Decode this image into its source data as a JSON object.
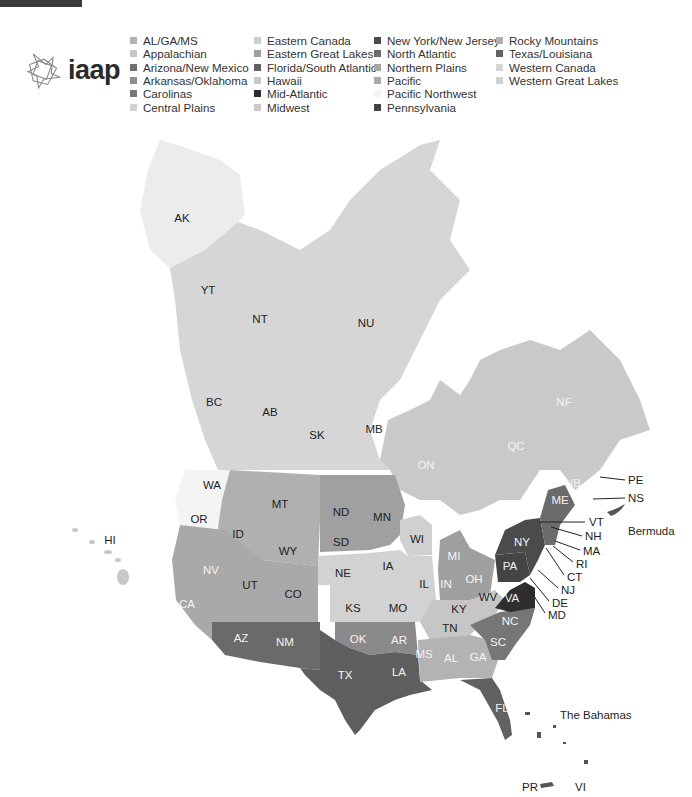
{
  "header": {
    "logo_text": "iaap"
  },
  "legend": {
    "columns": [
      [
        {
          "label": "AL/GA/MS",
          "color": "#b3b3b3"
        },
        {
          "label": "Appalachian",
          "color": "#c6c6c6"
        },
        {
          "label": "Arizona/New Mexico",
          "color": "#707070"
        },
        {
          "label": "Arkansas/Oklahoma",
          "color": "#8e8e8e"
        },
        {
          "label": "Carolinas",
          "color": "#767676"
        },
        {
          "label": "Central Plains",
          "color": "#d2d2d2"
        }
      ],
      [
        {
          "label": "Eastern Canada",
          "color": "#cdcdcd"
        },
        {
          "label": "Eastern Great Lakes",
          "color": "#9f9f9f"
        },
        {
          "label": "Florida/South Atlantic",
          "color": "#616161"
        },
        {
          "label": "Hawaii",
          "color": "#c8c8c8"
        },
        {
          "label": "Mid-Atlantic",
          "color": "#2e2e2e"
        },
        {
          "label": "Midwest",
          "color": "#c9c9c9"
        }
      ],
      [
        {
          "label": "New York/New Jersey",
          "color": "#4b4b4b"
        },
        {
          "label": "North Atlantic",
          "color": "#6b6b6b"
        },
        {
          "label": "Northern Plains",
          "color": "#a6a6a6"
        },
        {
          "label": "Pacific",
          "color": "#a9a9a9"
        },
        {
          "label": "Pacific Northwest",
          "color": "#f4f4f4"
        },
        {
          "label": "Pennsylvania",
          "color": "#444444"
        }
      ],
      [
        {
          "label": "Rocky Mountains",
          "color": "#b0b0b0"
        },
        {
          "label": "Texas/Louisiana",
          "color": "#626262"
        },
        {
          "label": "Western Canada",
          "color": "#d6d6d6"
        },
        {
          "label": "Western Great Lakes",
          "color": "#d0d0d0"
        }
      ]
    ]
  },
  "map": {
    "labels": [
      {
        "text": "AK",
        "x": 182,
        "y": 218,
        "light": false
      },
      {
        "text": "YT",
        "x": 208,
        "y": 290,
        "light": false
      },
      {
        "text": "NT",
        "x": 260,
        "y": 319,
        "light": false
      },
      {
        "text": "NU",
        "x": 366,
        "y": 323,
        "light": false
      },
      {
        "text": "BC",
        "x": 214,
        "y": 402,
        "light": false
      },
      {
        "text": "AB",
        "x": 270,
        "y": 412,
        "light": false
      },
      {
        "text": "SK",
        "x": 317,
        "y": 435,
        "light": false
      },
      {
        "text": "MB",
        "x": 374,
        "y": 429,
        "light": false
      },
      {
        "text": "ON",
        "x": 426,
        "y": 465,
        "light": true
      },
      {
        "text": "QC",
        "x": 516,
        "y": 446,
        "light": true
      },
      {
        "text": "NF",
        "x": 564,
        "y": 402,
        "light": true
      },
      {
        "text": "NB",
        "x": 573,
        "y": 483,
        "light": true
      },
      {
        "text": "ME",
        "x": 560,
        "y": 500,
        "light": true
      },
      {
        "text": "WA",
        "x": 212,
        "y": 485,
        "light": false
      },
      {
        "text": "OR",
        "x": 199,
        "y": 519,
        "light": false
      },
      {
        "text": "ID",
        "x": 238,
        "y": 534,
        "light": false
      },
      {
        "text": "MT",
        "x": 280,
        "y": 504,
        "light": false
      },
      {
        "text": "ND",
        "x": 341,
        "y": 512,
        "light": false
      },
      {
        "text": "MN",
        "x": 382,
        "y": 517,
        "light": false
      },
      {
        "text": "WY",
        "x": 288,
        "y": 551,
        "light": false
      },
      {
        "text": "SD",
        "x": 341,
        "y": 542,
        "light": false
      },
      {
        "text": "WI",
        "x": 417,
        "y": 539,
        "light": false
      },
      {
        "text": "MI",
        "x": 454,
        "y": 556,
        "light": true
      },
      {
        "text": "NY",
        "x": 522,
        "y": 542,
        "light": true
      },
      {
        "text": "NV",
        "x": 211,
        "y": 570,
        "light": true
      },
      {
        "text": "UT",
        "x": 250,
        "y": 585,
        "light": false
      },
      {
        "text": "CO",
        "x": 293,
        "y": 594,
        "light": false
      },
      {
        "text": "NE",
        "x": 343,
        "y": 573,
        "light": false
      },
      {
        "text": "IA",
        "x": 388,
        "y": 566,
        "light": false
      },
      {
        "text": "IL",
        "x": 424,
        "y": 584,
        "light": false
      },
      {
        "text": "IN",
        "x": 446,
        "y": 584,
        "light": true
      },
      {
        "text": "OH",
        "x": 474,
        "y": 579,
        "light": true
      },
      {
        "text": "PA",
        "x": 510,
        "y": 566,
        "light": true
      },
      {
        "text": "WV",
        "x": 488,
        "y": 597,
        "light": false
      },
      {
        "text": "VA",
        "x": 512,
        "y": 598,
        "light": true
      },
      {
        "text": "KY",
        "x": 459,
        "y": 609,
        "light": false
      },
      {
        "text": "KS",
        "x": 353,
        "y": 608,
        "light": false
      },
      {
        "text": "MO",
        "x": 398,
        "y": 608,
        "light": false
      },
      {
        "text": "CA",
        "x": 187,
        "y": 604,
        "light": true
      },
      {
        "text": "AZ",
        "x": 241,
        "y": 638,
        "light": true
      },
      {
        "text": "NM",
        "x": 285,
        "y": 642,
        "light": true
      },
      {
        "text": "OK",
        "x": 358,
        "y": 639,
        "light": true
      },
      {
        "text": "AR",
        "x": 399,
        "y": 640,
        "light": true
      },
      {
        "text": "TN",
        "x": 450,
        "y": 628,
        "light": false
      },
      {
        "text": "NC",
        "x": 510,
        "y": 621,
        "light": true
      },
      {
        "text": "SC",
        "x": 498,
        "y": 642,
        "light": true
      },
      {
        "text": "MS",
        "x": 424,
        "y": 654,
        "light": true
      },
      {
        "text": "AL",
        "x": 451,
        "y": 658,
        "light": true
      },
      {
        "text": "GA",
        "x": 478,
        "y": 657,
        "light": true
      },
      {
        "text": "LA",
        "x": 399,
        "y": 672,
        "light": true
      },
      {
        "text": "TX",
        "x": 345,
        "y": 675,
        "light": true
      },
      {
        "text": "FL",
        "x": 502,
        "y": 708,
        "light": true
      },
      {
        "text": "HI",
        "x": 110,
        "y": 540,
        "light": false
      }
    ],
    "callouts": [
      {
        "text": "PE",
        "x": 628,
        "y": 480,
        "x1": 600,
        "y1": 477,
        "x2": 625,
        "y2": 480
      },
      {
        "text": "NS",
        "x": 628,
        "y": 498,
        "x1": 593,
        "y1": 499,
        "x2": 625,
        "y2": 498
      },
      {
        "text": "VT",
        "x": 589,
        "y": 522,
        "x1": 539,
        "y1": 522,
        "x2": 585,
        "y2": 522
      },
      {
        "text": "NH",
        "x": 585,
        "y": 536,
        "x1": 551,
        "y1": 527,
        "x2": 582,
        "y2": 536
      },
      {
        "text": "MA",
        "x": 583,
        "y": 551,
        "x1": 555,
        "y1": 541,
        "x2": 580,
        "y2": 550
      },
      {
        "text": "RI",
        "x": 576,
        "y": 564,
        "x1": 553,
        "y1": 546,
        "x2": 573,
        "y2": 562
      },
      {
        "text": "CT",
        "x": 567,
        "y": 577,
        "x1": 546,
        "y1": 548,
        "x2": 564,
        "y2": 575
      },
      {
        "text": "NJ",
        "x": 561,
        "y": 590,
        "x1": 538,
        "y1": 570,
        "x2": 558,
        "y2": 588
      },
      {
        "text": "DE",
        "x": 552,
        "y": 603,
        "x1": 530,
        "y1": 578,
        "x2": 549,
        "y2": 601
      },
      {
        "text": "MD",
        "x": 548,
        "y": 615,
        "x1": 526,
        "y1": 584,
        "x2": 545,
        "y2": 613
      }
    ],
    "places": [
      {
        "text": "Bermuda",
        "x": 628,
        "y": 531
      },
      {
        "text": "The Bahamas",
        "x": 560,
        "y": 715
      },
      {
        "text": "PR",
        "x": 522,
        "y": 787
      },
      {
        "text": "VI",
        "x": 575,
        "y": 787
      }
    ]
  }
}
